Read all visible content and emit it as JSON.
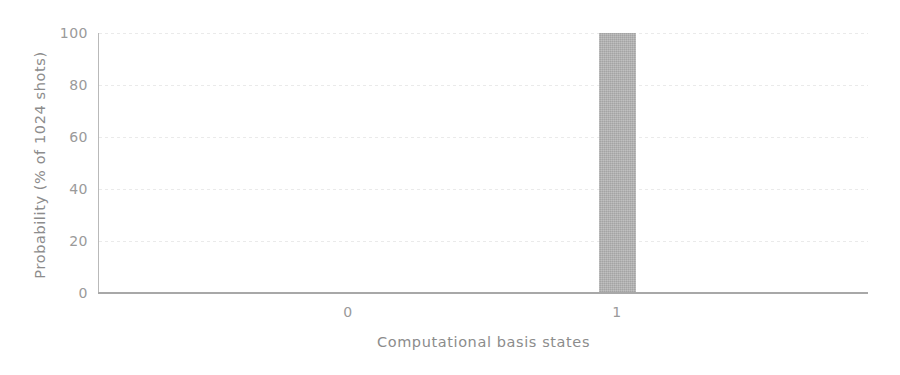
{
  "chart_data": {
    "type": "bar",
    "title": "",
    "subtitle": "",
    "xlabel": "Computational basis states",
    "ylabel": "Probability (% of 1024 shots)",
    "categories": [
      "0",
      "1"
    ],
    "values": [
      0,
      100
    ],
    "series": [
      {
        "name": "Probability",
        "values": [
          0,
          100
        ]
      }
    ],
    "ylim": [
      0,
      100
    ],
    "yticks": [
      0,
      20,
      40,
      60,
      80,
      100
    ],
    "ytick_labels": [
      "0",
      "20",
      "40",
      "60",
      "80",
      "100"
    ],
    "xtick_labels": [
      "0",
      "1"
    ],
    "grid": "horizontal-dotted",
    "legend": "none",
    "bar_color": "#b2b2b2",
    "axis_color": "#a8a8a8",
    "grid_color": "#e9e9e9",
    "text_color": "#9a9a9a",
    "background": "#ffffff"
  }
}
